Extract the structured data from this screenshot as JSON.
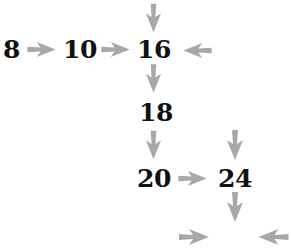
{
  "diagram": {
    "arrow_color": "#a8a8a8",
    "text_color": "#111111",
    "nodes": [
      {
        "id": "n8",
        "label": "8"
      },
      {
        "id": "n10",
        "label": "10"
      },
      {
        "id": "n16",
        "label": "16"
      },
      {
        "id": "n18",
        "label": "18"
      },
      {
        "id": "n20",
        "label": "20"
      },
      {
        "id": "n24",
        "label": "24"
      }
    ],
    "arrows": [
      {
        "from": "8",
        "to": "10",
        "direction": "right"
      },
      {
        "from": "10",
        "to": "16",
        "direction": "right"
      },
      {
        "from": "above",
        "to": "16",
        "direction": "down"
      },
      {
        "from": "right",
        "to": "16",
        "direction": "left"
      },
      {
        "from": "16",
        "to": "18",
        "direction": "down"
      },
      {
        "from": "18",
        "to": "20",
        "direction": "down"
      },
      {
        "from": "20",
        "to": "24",
        "direction": "right"
      },
      {
        "from": "above",
        "to": "24",
        "direction": "down"
      },
      {
        "from": "24",
        "to": "blank",
        "direction": "down"
      },
      {
        "from": "left",
        "to": "blank",
        "direction": "right"
      },
      {
        "from": "right",
        "to": "blank",
        "direction": "left"
      }
    ]
  }
}
